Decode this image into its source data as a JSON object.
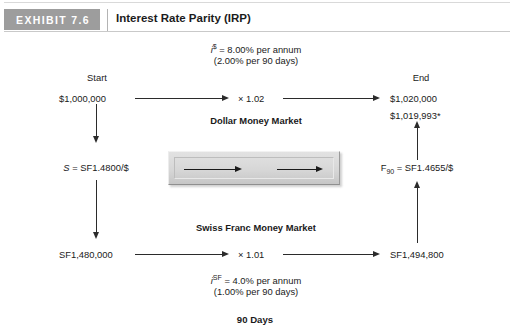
{
  "header": {
    "badge": "EXHIBIT 7.6",
    "title": "Interest Rate Parity (IRP)"
  },
  "diagram": {
    "top_annotation": {
      "rate_symbol": "i",
      "rate_superscript": "$",
      "rate_text": " = 8.00% per annum",
      "period_text": "(2.00% per 90 days)"
    },
    "bottom_annotation": {
      "rate_symbol": "i",
      "rate_superscript": "SF",
      "rate_text": " = 4.0% per annum",
      "period_text": "(1.00% per 90 days)"
    },
    "column_headers": {
      "start": "Start",
      "end": "End"
    },
    "markets": {
      "dollar": "Dollar Money Market",
      "swiss": "Swiss Franc Money Market"
    },
    "values": {
      "start_usd": "$1,000,000",
      "end_usd": "$1,020,000",
      "end_usd_arbitrage": "$1,019,993*",
      "start_chf": "SF1,480,000",
      "end_chf": "SF1,494,800",
      "usd_multiplier": "× 1.02",
      "chf_multiplier": "× 1.01"
    },
    "rates": {
      "spot_symbol": "S",
      "spot_text": " = SF1.4800/$",
      "forward_symbol": "F",
      "forward_subscript": "90",
      "forward_text": " = SF1.4655/$"
    },
    "timeline_label": "90 Days"
  },
  "colors": {
    "badge_bg": "#9d9d9d",
    "line": "#2b2b2b",
    "box_fill": "#d7d7d7",
    "text": "#1a1a1a"
  }
}
